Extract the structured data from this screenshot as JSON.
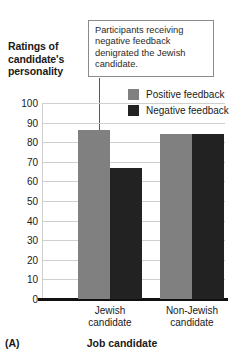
{
  "chart_data": {
    "type": "bar",
    "title": "",
    "ylabel": "Ratings of candidate's personality",
    "xlabel": "Job candidate",
    "panel_label": "(A)",
    "categories": [
      "Jewish candidate",
      "Non-Jewish candidate"
    ],
    "category_lines": [
      [
        "Jewish",
        "candidate"
      ],
      [
        "Non-Jewish",
        "candidate"
      ]
    ],
    "series": [
      {
        "name": "Positive feedback",
        "color": "#808080",
        "values": [
          86,
          84
        ]
      },
      {
        "name": "Negative feedback",
        "color": "#222222",
        "values": [
          67,
          84
        ]
      }
    ],
    "ylim": [
      0,
      100
    ],
    "ytick_step": 10,
    "yticks": [
      "100",
      "90",
      "80",
      "70",
      "60",
      "50",
      "40",
      "30",
      "20",
      "10",
      "0"
    ],
    "grid": true,
    "legend_position": "upper right",
    "annotation": "Participants receiving negative feedback denigrated the Jewish candidate.",
    "annotation_target": "Negative feedback bar, Jewish candidate"
  }
}
